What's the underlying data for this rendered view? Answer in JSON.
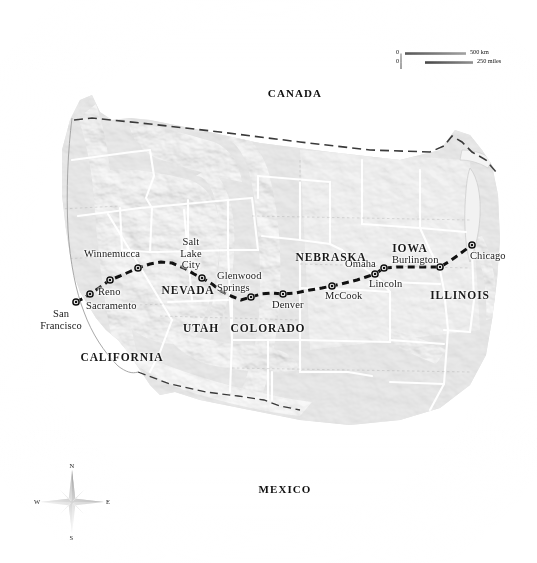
{
  "map": {
    "title": "Transcontinental railroad route map of the western United States",
    "countries": [
      {
        "name": "CANADA",
        "x": 295,
        "y": 88
      },
      {
        "name": "MEXICO",
        "x": 285,
        "y": 484
      }
    ],
    "states": [
      {
        "name": "CALIFORNIA",
        "x": 122,
        "y": 352
      },
      {
        "name": "NEVADA",
        "x": 188,
        "y": 285
      },
      {
        "name": "UTAH",
        "x": 201,
        "y": 323
      },
      {
        "name": "COLORADO",
        "x": 268,
        "y": 323
      },
      {
        "name": "NEBRASKA",
        "x": 331,
        "y": 252
      },
      {
        "name": "IOWA",
        "x": 410,
        "y": 243
      },
      {
        "name": "ILLINOIS",
        "x": 460,
        "y": 290
      }
    ],
    "cities": [
      {
        "name": "San\nFrancisco",
        "marker_x": 76,
        "marker_y": 302,
        "label_x": 61,
        "label_y": 308,
        "align": "center"
      },
      {
        "name": "Sacramento",
        "marker_x": 90,
        "marker_y": 294,
        "label_x": 86,
        "label_y": 300,
        "align": "left"
      },
      {
        "name": "Reno",
        "marker_x": 110,
        "marker_y": 280,
        "label_x": 98,
        "label_y": 286,
        "align": "left"
      },
      {
        "name": "Winnemucca",
        "marker_x": 138,
        "marker_y": 268,
        "label_x": 84,
        "label_y": 248,
        "align": "left"
      },
      {
        "name": "Salt\nLake\nCity",
        "marker_x": 202,
        "marker_y": 278,
        "label_x": 191,
        "label_y": 236,
        "align": "center"
      },
      {
        "name": "Glenwood\nSprings",
        "marker_x": 251,
        "marker_y": 297,
        "label_x": 217,
        "label_y": 270,
        "align": "left"
      },
      {
        "name": "Denver",
        "marker_x": 283,
        "marker_y": 294,
        "label_x": 272,
        "label_y": 299,
        "align": "left"
      },
      {
        "name": "McCook",
        "marker_x": 332,
        "marker_y": 286,
        "label_x": 325,
        "label_y": 290,
        "align": "left"
      },
      {
        "name": "Lincoln",
        "marker_x": 375,
        "marker_y": 274,
        "label_x": 369,
        "label_y": 278,
        "align": "left"
      },
      {
        "name": "Omaha",
        "marker_x": 384,
        "marker_y": 268,
        "label_x": 345,
        "label_y": 258,
        "align": "left"
      },
      {
        "name": "Burlington",
        "marker_x": 440,
        "marker_y": 267,
        "label_x": 392,
        "label_y": 254,
        "align": "left"
      },
      {
        "name": "Chicago",
        "marker_x": 472,
        "marker_y": 245,
        "label_x": 470,
        "label_y": 250,
        "align": "left"
      }
    ],
    "route": {
      "name": "rail-route",
      "stroke": "#111111",
      "points": "76,302 84,298 90,294 99,288 110,280 120,276 129,272 138,268 150,264 161,262 172,263 184,268 194,274 202,278 212,284 221,291 231,296 241,300 251,297 261,294 272,293 283,294 296,293 310,290 322,288 332,286 345,283 357,280 366,277 375,274 384,268 397,267 412,267 426,267 440,267 450,261 461,253 472,245"
    },
    "scale_bar": {
      "name": "scale-bar",
      "km": {
        "zero": "0",
        "label": "500 km"
      },
      "miles": {
        "zero": "0",
        "label": "250 miles"
      }
    },
    "compass": {
      "name": "compass-rose",
      "north": "N",
      "east": "E",
      "south": "S",
      "west": "W"
    },
    "colors": {
      "plains": "#cfcfcf",
      "mountains": "#a8a8a8",
      "highlands": "#9a9a9a",
      "border_white": "#ffffff",
      "route_black": "#111111",
      "text": "#1a1a1a",
      "background": "#ffffff"
    }
  }
}
